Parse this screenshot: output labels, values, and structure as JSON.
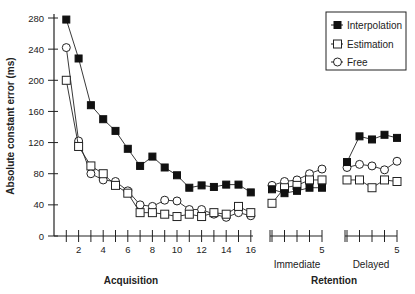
{
  "chart_data": {
    "type": "line",
    "title": "",
    "ylabel": "Absolute constant error (ms)",
    "ylim": [
      0,
      280
    ],
    "yticks": [
      0,
      40,
      80,
      120,
      160,
      200,
      240,
      280
    ],
    "grid": false,
    "legend_position": "top-right",
    "legend": [
      "Interpolation",
      "Estimation",
      "Free"
    ],
    "panels": [
      {
        "name": "Acquisition",
        "xlabel": "Acquisition",
        "x": [
          1,
          2,
          3,
          4,
          5,
          6,
          7,
          8,
          9,
          10,
          11,
          12,
          13,
          14,
          15,
          16
        ],
        "xtick_labels": [
          "2",
          "4",
          "6",
          "8",
          "10",
          "12",
          "14",
          "16"
        ],
        "series": [
          {
            "name": "Interpolation",
            "marker": "filled-square",
            "values": [
              278,
              228,
              168,
              150,
              135,
              112,
              90,
              102,
              88,
              78,
              62,
              65,
              63,
              66,
              66,
              56
            ]
          },
          {
            "name": "Estimation",
            "marker": "open-square",
            "values": [
              200,
              115,
              90,
              80,
              65,
              55,
              30,
              30,
              28,
              25,
              28,
              25,
              30,
              28,
              38,
              30
            ]
          },
          {
            "name": "Free",
            "marker": "open-circle",
            "values": [
              242,
              122,
              80,
              72,
              70,
              58,
              40,
              38,
              46,
              45,
              34,
              34,
              28,
              24,
              30,
              26
            ]
          }
        ]
      },
      {
        "name": "Immediate",
        "xlabel": "Immediate",
        "x": [
          1,
          2,
          3,
          4,
          5
        ],
        "xtick_labels": [
          "5"
        ],
        "series": [
          {
            "name": "Interpolation",
            "marker": "filled-square",
            "values": [
              60,
              55,
              58,
              62,
              62
            ]
          },
          {
            "name": "Estimation",
            "marker": "open-square",
            "values": [
              42,
              62,
              65,
              72,
              72
            ]
          },
          {
            "name": "Free",
            "marker": "open-circle",
            "values": [
              65,
              70,
              72,
              80,
              86
            ]
          }
        ]
      },
      {
        "name": "Delayed",
        "xlabel": "Delayed",
        "x": [
          1,
          2,
          3,
          4,
          5
        ],
        "xtick_labels": [
          "5"
        ],
        "series": [
          {
            "name": "Interpolation",
            "marker": "filled-square",
            "values": [
              95,
              128,
              124,
              130,
              126
            ]
          },
          {
            "name": "Estimation",
            "marker": "open-square",
            "values": [
              72,
              72,
              62,
              72,
              70
            ]
          },
          {
            "name": "Free",
            "marker": "open-circle",
            "values": [
              88,
              92,
              90,
              85,
              96
            ]
          }
        ]
      }
    ],
    "group_labels": {
      "acquisition": "Acquisition",
      "retention": "Retention"
    }
  },
  "labels": {
    "ylabel": "Absolute constant error (ms)",
    "acquisition": "Acquisition",
    "retention": "Retention",
    "immediate": "Immediate",
    "delayed": "Delayed",
    "legend_interp": "Interpolation",
    "legend_est": "Estimation",
    "legend_free": "Free"
  },
  "colors": {
    "line": "#222222",
    "filled": "#111111",
    "open": "#ffffff"
  }
}
